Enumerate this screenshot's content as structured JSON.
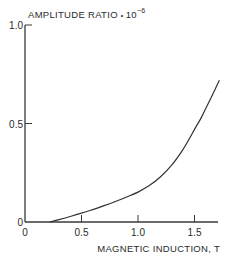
{
  "chart_data": {
    "type": "line",
    "title": "",
    "ylabel": "AMPLITUDE RATIO",
    "ylabel_multiplier_base": "10",
    "ylabel_multiplier_exp": "−6",
    "ylabel_separator": "•",
    "xlabel": "MAGNETIC INDUCTION, T",
    "xlim": [
      0,
      1.7
    ],
    "ylim": [
      0,
      1.0
    ],
    "xticks": [
      0,
      0.5,
      1.0,
      1.5
    ],
    "xtick_labels": [
      "0",
      "0.5",
      "1.0",
      "1.5"
    ],
    "yticks": [
      0,
      0.5,
      1.0
    ],
    "ytick_labels": [
      "0",
      "0.5",
      "1.0"
    ],
    "grid": false,
    "legend": "none",
    "series": [
      {
        "name": "amplitude ratio",
        "x": [
          0.22,
          0.3,
          0.4,
          0.5,
          0.6,
          0.7,
          0.8,
          0.9,
          1.0,
          1.1,
          1.2,
          1.3,
          1.4,
          1.5,
          1.56,
          1.62,
          1.68,
          1.72
        ],
        "y": [
          0.0,
          0.012,
          0.028,
          0.045,
          0.063,
          0.083,
          0.104,
          0.127,
          0.152,
          0.185,
          0.23,
          0.29,
          0.37,
          0.47,
          0.53,
          0.6,
          0.67,
          0.72
        ]
      }
    ]
  }
}
